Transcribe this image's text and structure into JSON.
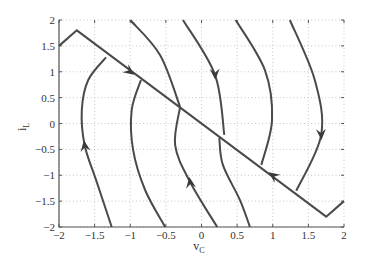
{
  "chart_data": {
    "type": "line",
    "title": "",
    "xlabel": "v_C",
    "ylabel": "i_L",
    "xlim": [
      -2,
      2
    ],
    "ylim": [
      -2,
      2
    ],
    "grid": true,
    "legend": null,
    "x_ticks": [
      -2,
      -1.5,
      -1,
      -0.5,
      0,
      0.5,
      1,
      1.5,
      2
    ],
    "x_tick_labels": [
      "−2",
      "−1.5",
      "−1",
      "−0.5",
      "0",
      "0.5",
      "1",
      "1.5",
      "2"
    ],
    "y_ticks": [
      2,
      1.5,
      1,
      0.5,
      0,
      -0.5,
      -1,
      -1.5,
      -2
    ],
    "y_tick_labels": [
      "2",
      "1.5",
      "1",
      "0.5",
      "0",
      "−0.5",
      "−1",
      "−1.5",
      "−2"
    ],
    "line_color": "#4a4a4a",
    "series": [
      {
        "name": "switching-line",
        "points": [
          [
            -2,
            1.5
          ],
          [
            -1.75,
            1.8
          ],
          [
            1.75,
            -1.8
          ],
          [
            2,
            -1.5
          ]
        ]
      },
      {
        "name": "trajectory-1",
        "points": [
          [
            -1.26,
            -2
          ],
          [
            -1.48,
            -1.09
          ],
          [
            -1.64,
            -0.42
          ],
          [
            -1.68,
            0.26
          ],
          [
            -1.59,
            0.84
          ],
          [
            -1.34,
            1.28
          ]
        ]
      },
      {
        "name": "trajectory-2",
        "points": [
          [
            -0.85,
            0.84
          ],
          [
            -0.98,
            0.26
          ],
          [
            -0.96,
            -0.51
          ],
          [
            -0.79,
            -1.29
          ],
          [
            -0.51,
            -2
          ]
        ]
      },
      {
        "name": "trajectory-3a",
        "points": [
          [
            -1.0,
            2
          ],
          [
            -0.58,
            1.32
          ],
          [
            -0.3,
            0.32
          ]
        ]
      },
      {
        "name": "trajectory-3b",
        "points": [
          [
            -0.3,
            0.32
          ],
          [
            -0.37,
            -0.42
          ],
          [
            -0.16,
            -1.13
          ],
          [
            0.22,
            -2
          ]
        ]
      },
      {
        "name": "trajectory-4a",
        "points": [
          [
            -0.26,
            2
          ],
          [
            0.19,
            0.94
          ],
          [
            0.32,
            -0.22
          ]
        ]
      },
      {
        "name": "trajectory-4b",
        "points": [
          [
            0.25,
            -0.28
          ],
          [
            0.3,
            -0.8
          ],
          [
            0.54,
            -1.48
          ],
          [
            0.68,
            -2
          ]
        ]
      },
      {
        "name": "trajectory-5",
        "points": [
          [
            0.48,
            2
          ],
          [
            0.89,
            1.03
          ],
          [
            0.99,
            0.07
          ],
          [
            0.84,
            -0.8
          ]
        ]
      },
      {
        "name": "trajectory-6",
        "points": [
          [
            1.24,
            2
          ],
          [
            1.59,
            0.84
          ],
          [
            1.68,
            -0.22
          ],
          [
            1.33,
            -1.3
          ]
        ]
      }
    ],
    "annotations": [
      {
        "type": "arrow",
        "at": [
          -1.0,
          1.0
        ],
        "direction": "down-right",
        "on": "switching-line"
      },
      {
        "type": "arrow",
        "at": [
          1.0,
          -1.0
        ],
        "direction": "up-left",
        "on": "switching-line"
      },
      {
        "type": "arrow",
        "at": [
          -1.64,
          -0.42
        ],
        "direction": "up",
        "on": "trajectory-1"
      },
      {
        "type": "arrow",
        "at": [
          0.19,
          0.94
        ],
        "direction": "down",
        "on": "trajectory-4a"
      },
      {
        "type": "arrow",
        "at": [
          -0.16,
          -1.13
        ],
        "direction": "up",
        "on": "trajectory-3b"
      },
      {
        "type": "arrow",
        "at": [
          1.68,
          -0.22
        ],
        "direction": "down",
        "on": "trajectory-6"
      }
    ]
  },
  "labels": {
    "xlabel_main": "v",
    "xlabel_sub": "C",
    "ylabel_main": "i",
    "ylabel_sub": "L"
  }
}
